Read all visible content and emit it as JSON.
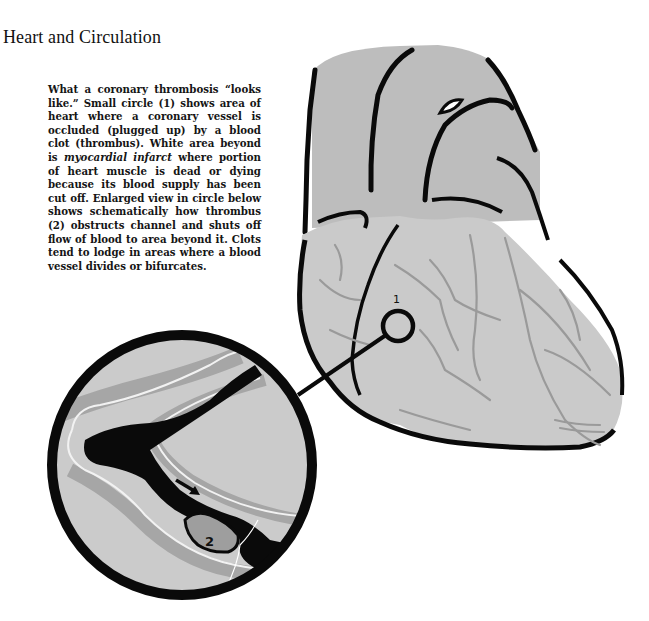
{
  "page": {
    "title": "Heart and Circulation"
  },
  "caption": {
    "part1": "What a coronary thrombosis “looks like.” Small circle (1) shows area of heart where a coronary vessel is occluded (plugged up) by a blood clot (thrombus). White area beyond is ",
    "emphasis": "myocardial infarct",
    "part2": " where portion of heart muscle is dead or dying because its blood supply has been cut off. Enlarged view in circle below shows schematically how thrombus (2) obstructs channel and shuts off flow of blood to area beyond it. Clots tend to lodge in areas where a blood vessel divides or bifurcates."
  },
  "illustration": {
    "label_small_circle": "1",
    "label_thrombus": "2",
    "colors": {
      "heart_fill": "#c9c9c9",
      "great_vessels_fill": "#bdbdbd",
      "vessel_lines": "#9a9a9a",
      "outline": "#0a0a0a",
      "thrombus_fill": "#9e9e9e",
      "background": "#ffffff"
    }
  }
}
